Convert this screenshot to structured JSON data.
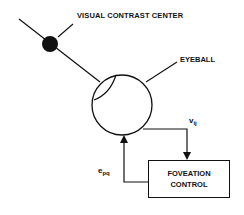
{
  "diagram": {
    "labels": {
      "visual_contrast_center": "VISUAL CONTRAST CENTER",
      "eyeball": "EYEBALL",
      "v": {
        "base": "v",
        "sub": "ij"
      },
      "e": {
        "base": "e",
        "sub": "pq"
      }
    },
    "box": {
      "line1": "FOVEATION",
      "line2": "CONTROL"
    },
    "colors": {
      "stroke": "#111111",
      "background": "#ffffff"
    }
  }
}
